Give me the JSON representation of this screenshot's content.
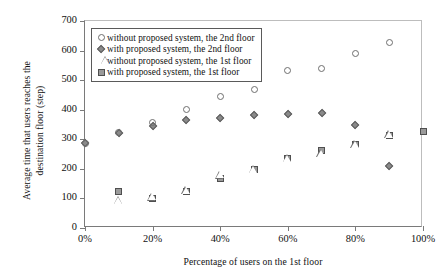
{
  "chart_data": {
    "type": "scatter",
    "title": "",
    "xlabel": "Percentage  of users on the 1st floor",
    "ylabel": "Average time that users reaches the\ndestination  floor (step)",
    "ylabel_line1": "Average time that users reaches the",
    "ylabel_line2": "destination  floor (step)",
    "xlim": [
      0,
      100
    ],
    "ylim": [
      0,
      700
    ],
    "xticks": [
      0,
      20,
      40,
      60,
      80,
      100
    ],
    "xticklabels": [
      "0%",
      "20%",
      "40%",
      "60%",
      "80%",
      "100%"
    ],
    "yticks": [
      0,
      100,
      200,
      300,
      400,
      500,
      600,
      700
    ],
    "yticklabels": [
      "0",
      "100",
      "200",
      "300",
      "400",
      "500",
      "600",
      "700"
    ],
    "grid": false,
    "legend_position": "upper-left-inside",
    "series": [
      {
        "name": "without proposed system, the 2nd floor",
        "marker": "open-circle",
        "color": "#6e6e6e",
        "points": [
          {
            "x": 0,
            "y": 287
          },
          {
            "x": 10,
            "y": 322
          },
          {
            "x": 20,
            "y": 358
          },
          {
            "x": 30,
            "y": 402
          },
          {
            "x": 40,
            "y": 444
          },
          {
            "x": 50,
            "y": 470
          },
          {
            "x": 60,
            "y": 533
          },
          {
            "x": 70,
            "y": 540
          },
          {
            "x": 80,
            "y": 591
          },
          {
            "x": 90,
            "y": 628
          }
        ]
      },
      {
        "name": "with proposed system, the 2nd floor",
        "marker": "filled-diamond",
        "color": "#8a8a8a",
        "points": [
          {
            "x": 0,
            "y": 287
          },
          {
            "x": 10,
            "y": 320
          },
          {
            "x": 20,
            "y": 345
          },
          {
            "x": 30,
            "y": 365
          },
          {
            "x": 40,
            "y": 373
          },
          {
            "x": 50,
            "y": 383
          },
          {
            "x": 60,
            "y": 386
          },
          {
            "x": 70,
            "y": 388
          },
          {
            "x": 80,
            "y": 347
          },
          {
            "x": 90,
            "y": 210
          }
        ]
      },
      {
        "name": "without proposed system, the 1st floor",
        "marker": "open-triangle",
        "color": "#6e6e6e",
        "points": [
          {
            "x": 10,
            "y": 92
          },
          {
            "x": 20,
            "y": 104
          },
          {
            "x": 30,
            "y": 125
          },
          {
            "x": 40,
            "y": 178
          },
          {
            "x": 50,
            "y": 196
          },
          {
            "x": 60,
            "y": 235
          },
          {
            "x": 70,
            "y": 252
          },
          {
            "x": 80,
            "y": 282
          },
          {
            "x": 90,
            "y": 315
          }
        ]
      },
      {
        "name": "with proposed system, the 1st floor",
        "marker": "filled-square",
        "color": "#9a9a9a",
        "points": [
          {
            "x": 10,
            "y": 123
          },
          {
            "x": 20,
            "y": 101
          },
          {
            "x": 30,
            "y": 122
          },
          {
            "x": 40,
            "y": 167
          },
          {
            "x": 50,
            "y": 197
          },
          {
            "x": 60,
            "y": 234
          },
          {
            "x": 70,
            "y": 262
          },
          {
            "x": 80,
            "y": 281
          },
          {
            "x": 90,
            "y": 312
          },
          {
            "x": 100,
            "y": 325
          }
        ]
      }
    ]
  },
  "legend": {
    "items": [
      {
        "label": "without proposed system, the 2nd floor",
        "marker": "open-circle"
      },
      {
        "label": "with proposed system, the 2nd floor",
        "marker": "filled-diamond"
      },
      {
        "label": "without proposed system, the 1st floor",
        "marker": "open-triangle"
      },
      {
        "label": "with proposed system, the 1st floor",
        "marker": "filled-square"
      }
    ]
  }
}
